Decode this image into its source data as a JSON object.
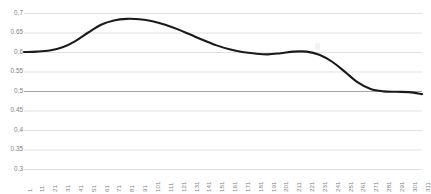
{
  "chart_data": {
    "type": "line",
    "title": "",
    "subtitle": "",
    "xlabel": "",
    "ylabel": "",
    "grid": true,
    "legend": false,
    "legend_position": "none",
    "line_color": "#1a1a1a",
    "gridline_color": "#d9d9d9",
    "baseline_gridline_color": "#a6a6a6",
    "baseline_value": 0.5,
    "tick_label_color": "#7f7f7f",
    "background_color": "#ffffff",
    "xlim": [
      1,
      311
    ],
    "ylim": [
      0.3,
      0.7
    ],
    "yticks": [
      0.3,
      0.35,
      0.4,
      0.45,
      0.5,
      0.55,
      0.6,
      0.65,
      0.7
    ],
    "ytick_labels": [
      "0.3",
      "0.35",
      "0.4",
      "0.45",
      "0.5",
      "0.55",
      "0.6",
      "0.65",
      "0.7"
    ],
    "xticks": [
      1,
      11,
      21,
      31,
      41,
      51,
      61,
      71,
      81,
      91,
      101,
      111,
      121,
      131,
      141,
      151,
      161,
      171,
      181,
      191,
      201,
      211,
      221,
      231,
      241,
      251,
      261,
      271,
      281,
      291,
      301,
      311
    ],
    "xtick_labels": [
      "1",
      "11",
      "21",
      "31",
      "41",
      "51",
      "61",
      "71",
      "81",
      "91",
      "101",
      "111",
      "121",
      "131",
      "141",
      "151",
      "161",
      "171",
      "181",
      "191",
      "201",
      "211",
      "221",
      "231",
      "241",
      "251",
      "261",
      "271",
      "281",
      "291",
      "301",
      "311"
    ],
    "xtick_label_rotation": -90,
    "series": [
      {
        "name": "series-1",
        "x": [
          1,
          11,
          21,
          31,
          41,
          51,
          61,
          71,
          81,
          91,
          101,
          111,
          121,
          131,
          141,
          151,
          161,
          171,
          181,
          191,
          201,
          211,
          221,
          231,
          241,
          251,
          261,
          271,
          281,
          291,
          301,
          311
        ],
        "values": [
          0.6,
          0.601,
          0.604,
          0.612,
          0.628,
          0.65,
          0.67,
          0.681,
          0.685,
          0.684,
          0.679,
          0.67,
          0.658,
          0.644,
          0.63,
          0.617,
          0.607,
          0.6,
          0.596,
          0.594,
          0.597,
          0.601,
          0.601,
          0.593,
          0.575,
          0.549,
          0.522,
          0.505,
          0.499,
          0.498,
          0.497,
          0.492
        ]
      }
    ]
  },
  "plot_geometry": {
    "left": 24,
    "right": 422,
    "top_value_y": 13,
    "bottom_value_y": 169
  }
}
